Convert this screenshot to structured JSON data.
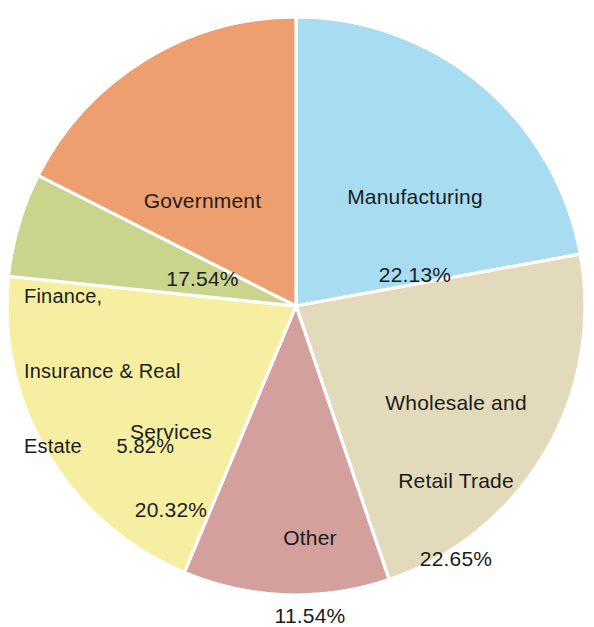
{
  "chart_data": {
    "type": "pie",
    "title": "",
    "subtitle": "",
    "xlabel": "",
    "ylabel": "",
    "legend_position": "none",
    "labels_inside_slices": true,
    "start_angle_deg": 0,
    "direction": "clockwise",
    "units": "percent",
    "total": 100.0,
    "categories": [
      "Manufacturing",
      "Wholesale and Retail Trade",
      "Other",
      "Services",
      "Finance, Insurance & Real Estate",
      "Government"
    ],
    "values": [
      22.13,
      22.65,
      11.54,
      20.32,
      5.82,
      17.54
    ],
    "slices": [
      {
        "name": "Manufacturing",
        "value": 22.13,
        "value_text": "22.13%",
        "label_line1": "Manufacturing",
        "label_line2": "22.13%",
        "color": "#A7DCF1"
      },
      {
        "name": "Wholesale and Retail Trade",
        "value": 22.65,
        "value_text": "22.65%",
        "label_line1": "Wholesale and",
        "label_line2": "Retail Trade",
        "label_line3": "22.65%",
        "color": "#E3DABB"
      },
      {
        "name": "Other",
        "value": 11.54,
        "value_text": "11.54%",
        "label_line1": "Other",
        "label_line2": "11.54%",
        "color": "#D3A09E"
      },
      {
        "name": "Services",
        "value": 20.32,
        "value_text": "20.32%",
        "label_line1": "Services",
        "label_line2": "20.32%",
        "color": "#F6EFA2"
      },
      {
        "name": "Finance, Insurance & Real Estate",
        "value": 5.82,
        "value_text": "5.82%",
        "label_line1": "Finance,",
        "label_line2": "Insurance & Real",
        "label_line3": "Estate      5.82%",
        "color": "#C9D48C"
      },
      {
        "name": "Government",
        "value": 17.54,
        "value_text": "17.54%",
        "label_line1": "Government",
        "label_line2": "17.54%",
        "color": "#EE9F6F"
      }
    ],
    "colors": [
      "#A7DCF1",
      "#E3DABB",
      "#D3A09E",
      "#F6EFA2",
      "#C9D48C",
      "#EE9F6F"
    ],
    "background_color": "#FFFFFF",
    "slice_border_color": "#FFFFFF",
    "label_text_color": "#1B1B1B"
  },
  "geometry": {
    "center_x": 296,
    "center_y": 306,
    "radius": 289
  }
}
